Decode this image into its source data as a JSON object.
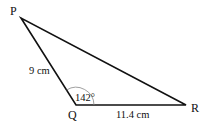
{
  "diagram": {
    "type": "triangle",
    "vertices": {
      "P": {
        "label": "P",
        "x": 21,
        "y": 18
      },
      "Q": {
        "label": "Q",
        "x": 76,
        "y": 105
      },
      "R": {
        "label": "R",
        "x": 186,
        "y": 105
      }
    },
    "sides": {
      "PQ": {
        "label": "9 cm"
      },
      "QR": {
        "label": "11.4 cm"
      }
    },
    "angles": {
      "Q": {
        "label": "142°"
      }
    },
    "colors": {
      "line": "#111111",
      "arc": "#888888",
      "background": "#ffffff"
    }
  }
}
